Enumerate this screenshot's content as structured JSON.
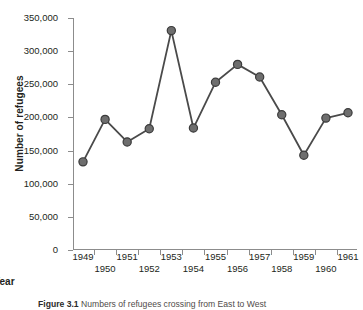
{
  "figure": {
    "number_label": "Figure 3.1",
    "caption_text": "Numbers of refugees crossing from East to West"
  },
  "chart_data": {
    "type": "line",
    "title": "",
    "subtitle": "",
    "xlabel": "Year",
    "ylabel": "Number of refugees",
    "x": [
      1949,
      1950,
      1951,
      1952,
      1953,
      1954,
      1955,
      1956,
      1957,
      1958,
      1959,
      1960,
      1961
    ],
    "categories": [
      "1949",
      "1950",
      "1951",
      "1952",
      "1953",
      "1954",
      "1955",
      "1956",
      "1957",
      "1958",
      "1959",
      "1960",
      "1961"
    ],
    "values": [
      133000,
      197000,
      163000,
      183000,
      331000,
      184000,
      253000,
      280000,
      261000,
      204000,
      143000,
      199000,
      207000
    ],
    "series": [
      {
        "name": "Refugees crossing from East to West",
        "values": [
          133000,
          197000,
          163000,
          183000,
          331000,
          184000,
          253000,
          280000,
          261000,
          204000,
          143000,
          199000,
          207000
        ]
      }
    ],
    "ylim": [
      0,
      350000
    ],
    "xlim": [
      1949,
      1961
    ],
    "y_ticks": [
      0,
      50000,
      100000,
      150000,
      200000,
      250000,
      300000,
      350000
    ],
    "y_tick_labels": [
      "0",
      "50,000",
      "100,000",
      "150,000",
      "200,000",
      "250,000",
      "300,000",
      "350,000"
    ],
    "x_tick_labels_top_row": [
      "1949",
      "1951",
      "1953",
      "1955",
      "1957",
      "1959",
      "1961"
    ],
    "x_tick_labels_bottom_row": [
      "1950",
      "1952",
      "1954",
      "1956",
      "1958",
      "1960"
    ],
    "grid": false,
    "legend": "none",
    "marker": "circle",
    "marker_color": "#6e6e6e",
    "marker_edge_color": "#3b3b3b",
    "line_color": "#4a4a4a",
    "axis_color": "#8c8c8c",
    "text_color": "#231f20",
    "background_color": "#ffffff"
  }
}
